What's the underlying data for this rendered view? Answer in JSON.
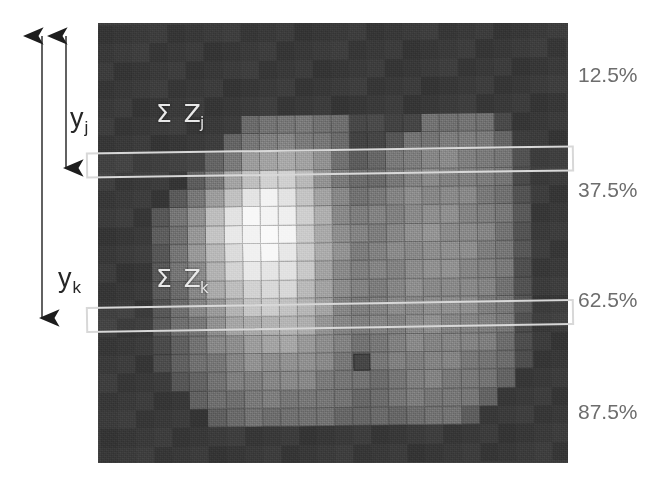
{
  "figure": {
    "kind": "grayscale-dose-image-with-profile-bands",
    "background_color": "#ffffff",
    "image_panel": {
      "background_color": "#3f3f3f",
      "grid_columns": 26,
      "grid_rows": 24,
      "note": "blocky pixelated grayscale dose distribution"
    }
  },
  "overlay_labels": [
    {
      "name": "sum-z-j",
      "text": "Σ Z",
      "subscript": "j"
    },
    {
      "name": "sum-z-k",
      "text": "Σ Z",
      "subscript": "k"
    }
  ],
  "axis_arrows": [
    {
      "name": "y-j",
      "label": "y",
      "subscript": "j",
      "direction": "double-headed-vertical"
    },
    {
      "name": "y-k",
      "label": "y",
      "subscript": "k",
      "direction": "double-headed-vertical"
    }
  ],
  "depth_labels": [
    {
      "value": "12.5%",
      "top": 63
    },
    {
      "value": "37.5%",
      "top": 178
    },
    {
      "value": "62.5%",
      "top": 288
    },
    {
      "value": "87.5%",
      "top": 400
    }
  ],
  "bands": [
    {
      "name": "profile-band-j",
      "stroke_color": "#d8d8d8"
    },
    {
      "name": "profile-band-k",
      "stroke_color": "#d8d8d8"
    }
  ],
  "chart_data": {
    "type": "heatmap",
    "title": "",
    "xlabel": "",
    "ylabel": "",
    "legend": [],
    "grid": true,
    "colormap": "grayscale",
    "value_range": [
      0,
      255
    ],
    "annotations": [
      {
        "text": "Σ Z_j",
        "kind": "profile-row-sum"
      },
      {
        "text": "Σ Z_k",
        "kind": "profile-row-sum"
      },
      {
        "text": "y_j",
        "kind": "depth-arrow"
      },
      {
        "text": "y_k",
        "kind": "depth-arrow"
      },
      {
        "text": "12.5%",
        "kind": "depth-fraction"
      },
      {
        "text": "37.5%",
        "kind": "depth-fraction"
      },
      {
        "text": "62.5%",
        "kind": "depth-fraction"
      },
      {
        "text": "87.5%",
        "kind": "depth-fraction"
      }
    ],
    "rows": 24,
    "cols": 26,
    "values": [
      [
        58,
        58,
        58,
        58,
        58,
        58,
        58,
        58,
        58,
        58,
        58,
        58,
        58,
        58,
        58,
        58,
        58,
        58,
        58,
        58,
        58,
        58,
        58,
        58,
        58,
        58
      ],
      [
        58,
        58,
        58,
        58,
        58,
        58,
        58,
        58,
        58,
        58,
        58,
        58,
        58,
        58,
        58,
        58,
        58,
        58,
        58,
        58,
        58,
        58,
        58,
        58,
        58,
        58
      ],
      [
        58,
        58,
        58,
        58,
        58,
        58,
        58,
        58,
        58,
        58,
        58,
        58,
        58,
        58,
        58,
        58,
        58,
        58,
        58,
        58,
        58,
        58,
        58,
        58,
        58,
        58
      ],
      [
        58,
        58,
        58,
        58,
        58,
        58,
        58,
        58,
        58,
        58,
        58,
        58,
        58,
        58,
        58,
        58,
        58,
        58,
        58,
        58,
        58,
        58,
        58,
        58,
        58,
        58
      ],
      [
        58,
        58,
        58,
        58,
        58,
        58,
        58,
        58,
        58,
        58,
        58,
        58,
        58,
        58,
        58,
        58,
        58,
        58,
        58,
        58,
        58,
        58,
        58,
        58,
        58,
        58
      ],
      [
        58,
        58,
        58,
        58,
        58,
        58,
        58,
        58,
        112,
        118,
        118,
        118,
        118,
        112,
        70,
        70,
        70,
        70,
        112,
        118,
        118,
        112,
        70,
        58,
        58,
        58
      ],
      [
        58,
        58,
        58,
        58,
        58,
        58,
        58,
        105,
        120,
        126,
        128,
        126,
        120,
        105,
        72,
        72,
        85,
        112,
        120,
        126,
        124,
        118,
        105,
        62,
        58,
        58
      ],
      [
        58,
        58,
        58,
        58,
        58,
        58,
        98,
        118,
        150,
        165,
        168,
        158,
        138,
        112,
        88,
        95,
        112,
        124,
        130,
        132,
        128,
        120,
        112,
        72,
        58,
        58
      ],
      [
        58,
        58,
        58,
        58,
        58,
        95,
        120,
        160,
        195,
        210,
        206,
        180,
        150,
        122,
        105,
        112,
        122,
        130,
        134,
        134,
        130,
        122,
        112,
        78,
        58,
        58
      ],
      [
        58,
        58,
        58,
        58,
        92,
        118,
        152,
        196,
        228,
        240,
        232,
        198,
        162,
        132,
        118,
        122,
        130,
        136,
        138,
        138,
        134,
        126,
        115,
        82,
        58,
        58
      ],
      [
        58,
        58,
        58,
        88,
        115,
        150,
        192,
        226,
        244,
        248,
        240,
        205,
        170,
        140,
        126,
        128,
        134,
        140,
        142,
        140,
        136,
        128,
        118,
        85,
        58,
        58
      ],
      [
        58,
        58,
        58,
        90,
        118,
        152,
        194,
        228,
        246,
        250,
        242,
        208,
        172,
        142,
        128,
        130,
        136,
        142,
        144,
        142,
        138,
        130,
        120,
        86,
        58,
        58
      ],
      [
        58,
        58,
        58,
        90,
        118,
        150,
        190,
        222,
        240,
        244,
        236,
        204,
        170,
        142,
        128,
        130,
        136,
        142,
        144,
        142,
        138,
        130,
        120,
        86,
        58,
        58
      ],
      [
        58,
        58,
        58,
        88,
        114,
        144,
        180,
        210,
        228,
        232,
        226,
        198,
        168,
        140,
        127,
        129,
        135,
        141,
        143,
        141,
        137,
        129,
        119,
        85,
        58,
        58
      ],
      [
        58,
        58,
        58,
        86,
        110,
        136,
        168,
        195,
        212,
        216,
        212,
        190,
        164,
        138,
        126,
        128,
        134,
        140,
        142,
        140,
        136,
        128,
        118,
        84,
        58,
        58
      ],
      [
        58,
        58,
        58,
        84,
        106,
        128,
        155,
        178,
        194,
        198,
        196,
        180,
        158,
        135,
        124,
        126,
        132,
        138,
        140,
        138,
        134,
        126,
        116,
        82,
        58,
        58
      ],
      [
        58,
        58,
        58,
        82,
        102,
        120,
        142,
        160,
        174,
        178,
        178,
        168,
        150,
        132,
        122,
        124,
        130,
        136,
        138,
        136,
        132,
        124,
        114,
        80,
        58,
        58
      ],
      [
        58,
        58,
        58,
        80,
        98,
        114,
        132,
        146,
        158,
        162,
        162,
        156,
        142,
        128,
        120,
        122,
        128,
        134,
        136,
        134,
        130,
        122,
        112,
        78,
        58,
        58
      ],
      [
        58,
        58,
        58,
        78,
        95,
        108,
        122,
        134,
        144,
        148,
        148,
        144,
        134,
        124,
        95,
        118,
        124,
        130,
        132,
        130,
        126,
        118,
        108,
        74,
        58,
        58
      ],
      [
        58,
        58,
        58,
        58,
        92,
        102,
        114,
        124,
        132,
        136,
        136,
        132,
        126,
        118,
        112,
        114,
        120,
        126,
        128,
        126,
        122,
        114,
        95,
        58,
        58,
        58
      ],
      [
        58,
        58,
        58,
        58,
        58,
        96,
        106,
        114,
        122,
        124,
        124,
        122,
        118,
        112,
        108,
        110,
        116,
        120,
        122,
        120,
        116,
        105,
        58,
        58,
        58,
        58
      ],
      [
        58,
        58,
        58,
        58,
        58,
        58,
        98,
        106,
        112,
        114,
        114,
        112,
        110,
        106,
        102,
        104,
        108,
        112,
        114,
        112,
        98,
        58,
        58,
        58,
        58,
        58
      ],
      [
        58,
        58,
        58,
        58,
        58,
        58,
        58,
        58,
        58,
        58,
        58,
        58,
        58,
        58,
        58,
        58,
        58,
        58,
        58,
        58,
        58,
        58,
        58,
        58,
        58,
        58
      ],
      [
        58,
        58,
        58,
        58,
        58,
        58,
        58,
        58,
        58,
        58,
        58,
        58,
        58,
        58,
        58,
        58,
        58,
        58,
        58,
        58,
        58,
        58,
        58,
        58,
        58,
        58
      ]
    ]
  }
}
